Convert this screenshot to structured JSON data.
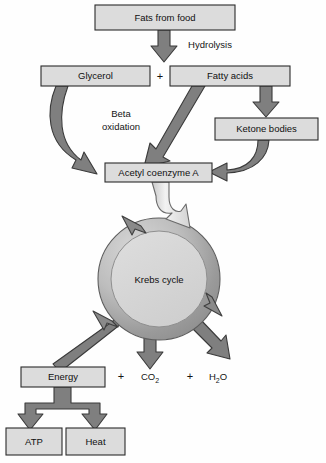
{
  "diagram": {
    "colors": {
      "box_fill": "#dcdcdc",
      "box_stroke": "#2b2b2b",
      "arrow_fill": "#7f7f7f",
      "arrow_stroke": "#3a3a3a",
      "ring_fill": "#b3b3b3",
      "ring_inner_fill": "#d5d5d5",
      "funnel_fill": "#efefef",
      "background": "#fefefe",
      "text": "#101010"
    },
    "nodes": [
      {
        "id": "fats",
        "label": "Fats from food",
        "x": 95,
        "y": 5,
        "w": 140,
        "h": 25
      },
      {
        "id": "glycerol",
        "label": "Glycerol",
        "x": 41,
        "y": 66,
        "w": 109,
        "h": 20
      },
      {
        "id": "fatty_acids",
        "label": "Fatty acids",
        "x": 170,
        "y": 66,
        "w": 120,
        "h": 20
      },
      {
        "id": "ketone",
        "label": "Ketone bodies",
        "x": 215,
        "y": 118,
        "w": 103,
        "h": 22
      },
      {
        "id": "acetyl",
        "label": "Acetyl coenzyme A",
        "x": 105,
        "y": 163,
        "w": 107,
        "h": 19
      },
      {
        "id": "energy",
        "label": "Energy",
        "x": 21,
        "y": 367,
        "w": 84,
        "h": 20
      },
      {
        "id": "atp",
        "label": "ATP",
        "x": 6,
        "y": 428,
        "w": 56,
        "h": 27
      },
      {
        "id": "heat",
        "label": "Heat",
        "x": 66,
        "y": 428,
        "w": 59,
        "h": 27
      }
    ],
    "cycle": {
      "label": "Krebs cycle",
      "cx": 159,
      "cy": 279,
      "r_outer": 61,
      "r_inner": 48
    },
    "labels": [
      {
        "id": "hydrolysis",
        "text": "Hydrolysis",
        "x": 210,
        "y": 48
      },
      {
        "id": "beta",
        "text": "Beta",
        "x": 121,
        "y": 117
      },
      {
        "id": "beta_ox",
        "text": "oxidation",
        "x": 121,
        "y": 130
      }
    ],
    "operators": [
      {
        "id": "plus-split",
        "text": "+",
        "x": 160,
        "y": 80
      },
      {
        "id": "plus-co2",
        "text": "+",
        "x": 121,
        "y": 380
      },
      {
        "id": "plus-h2o",
        "text": "+",
        "x": 190,
        "y": 380
      }
    ],
    "products": [
      {
        "id": "co2",
        "base": "CO",
        "sub": "2",
        "x": 150,
        "y": 380
      },
      {
        "id": "h2o",
        "base": "H",
        "sub": "2",
        "tail": "O",
        "x": 218,
        "y": 380
      }
    ],
    "edges": [
      {
        "id": "fats-to-split",
        "from": "fats",
        "to": "split-point",
        "kind": "block-arrow-down"
      },
      {
        "id": "glycerol-to-acetyl",
        "from": "glycerol",
        "to": "acetyl",
        "kind": "curved-arrow"
      },
      {
        "id": "fattyacids-to-acetyl",
        "from": "fatty_acids",
        "to": "acetyl",
        "kind": "diagonal-arrow",
        "label": "Beta oxidation"
      },
      {
        "id": "fattyacids-to-ketone",
        "from": "fatty_acids",
        "to": "ketone",
        "kind": "block-arrow-down"
      },
      {
        "id": "ketone-to-acetyl",
        "from": "ketone",
        "to": "acetyl",
        "kind": "curved-arrow"
      },
      {
        "id": "acetyl-to-krebs",
        "from": "acetyl",
        "to": "krebs",
        "kind": "funnel-arrow"
      },
      {
        "id": "krebs-to-energy",
        "from": "energy",
        "to": "krebs",
        "kind": "diagonal-arrow"
      },
      {
        "id": "krebs-to-co2",
        "from": "krebs",
        "to": "co2",
        "kind": "block-arrow-down"
      },
      {
        "id": "krebs-to-h2o",
        "from": "krebs",
        "to": "h2o",
        "kind": "diagonal-arrow"
      },
      {
        "id": "energy-to-atp",
        "from": "energy",
        "to": "atp",
        "kind": "fork-arrow"
      },
      {
        "id": "energy-to-heat",
        "from": "energy",
        "to": "heat",
        "kind": "fork-arrow"
      }
    ]
  }
}
